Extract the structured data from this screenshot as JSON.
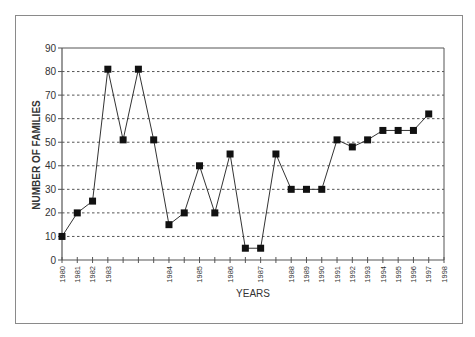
{
  "chart_data": {
    "type": "line",
    "title": "",
    "xlabel": "YEARS",
    "ylabel": "NUMBER OF FAMILIES",
    "ylim": [
      0,
      90
    ],
    "yticks": [
      0,
      10,
      20,
      30,
      40,
      50,
      60,
      70,
      80,
      90
    ],
    "grid": {
      "horizontal": true,
      "style": "dotted"
    },
    "legend": null,
    "x_ticks": [
      "1980",
      "1981",
      "1982",
      "1983",
      "",
      "",
      "",
      "1984",
      "",
      "1985",
      "",
      "1986",
      "",
      "1987",
      "",
      "1988",
      "1989",
      "1990",
      "1991",
      "1992",
      "1993",
      "1994",
      "1995",
      "1996",
      "1997",
      "1998"
    ],
    "series": [
      {
        "name": "Number of families",
        "marker": "square",
        "color": "#111111",
        "points": [
          {
            "tick": 0,
            "label": "1980",
            "value": 10
          },
          {
            "tick": 1,
            "label": "1981",
            "value": 20
          },
          {
            "tick": 2,
            "label": "1982",
            "value": 25
          },
          {
            "tick": 3,
            "label": "1983",
            "value": 81
          },
          {
            "tick": 4,
            "label": "",
            "value": 51
          },
          {
            "tick": 5,
            "label": "",
            "value": 81
          },
          {
            "tick": 6,
            "label": "",
            "value": 51
          },
          {
            "tick": 7,
            "label": "1984",
            "value": 15
          },
          {
            "tick": 8,
            "label": "",
            "value": 20
          },
          {
            "tick": 9,
            "label": "1985",
            "value": 40
          },
          {
            "tick": 10,
            "label": "",
            "value": 20
          },
          {
            "tick": 11,
            "label": "1986",
            "value": 45
          },
          {
            "tick": 12,
            "label": "",
            "value": 5
          },
          {
            "tick": 13,
            "label": "1987",
            "value": 5
          },
          {
            "tick": 14,
            "label": "",
            "value": 45
          },
          {
            "tick": 15,
            "label": "1988",
            "value": 30
          },
          {
            "tick": 16,
            "label": "1989",
            "value": 30
          },
          {
            "tick": 17,
            "label": "1990",
            "value": 30
          },
          {
            "tick": 18,
            "label": "1991",
            "value": 51
          },
          {
            "tick": 19,
            "label": "1992",
            "value": 48
          },
          {
            "tick": 20,
            "label": "1993",
            "value": 51
          },
          {
            "tick": 21,
            "label": "1994",
            "value": 55
          },
          {
            "tick": 22,
            "label": "1995",
            "value": 55
          },
          {
            "tick": 23,
            "label": "1996",
            "value": 55
          },
          {
            "tick": 24,
            "label": "1997",
            "value": 62
          }
        ]
      }
    ]
  },
  "colors": {
    "line": "#333333",
    "marker": "#111111",
    "axis": "#555555",
    "grid": "#555555",
    "frame": "#8a8a8a",
    "text": "#333333"
  }
}
